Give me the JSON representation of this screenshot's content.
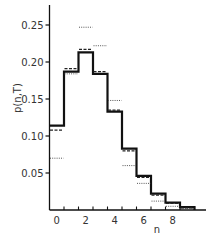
{
  "chart_data": {
    "type": "bar",
    "subtype": "step-histogram",
    "title": "",
    "xlabel": "n",
    "ylabel": "p(n,T)",
    "xlim": [
      -0.5,
      10.5
    ],
    "ylim": [
      0,
      0.277
    ],
    "x_ticks": [
      0,
      2,
      4,
      6,
      8
    ],
    "x_tick_labels": [
      "0",
      "2",
      "4",
      "6",
      "8"
    ],
    "y_ticks": [
      0.05,
      0.1,
      0.15,
      0.2,
      0.25
    ],
    "y_tick_labels": [
      "0.05",
      "0.10",
      "0.15",
      "0.20",
      "0.25"
    ],
    "grid": false,
    "legend": null,
    "categories": [
      0,
      1,
      2,
      3,
      4,
      5,
      6,
      7,
      8,
      9
    ],
    "series": [
      {
        "name": "solid",
        "style": "solid",
        "values": [
          0.114,
          0.187,
          0.213,
          0.184,
          0.133,
          0.083,
          0.046,
          0.022,
          0.01,
          0.004
        ]
      },
      {
        "name": "dashed",
        "style": "dashed",
        "values": [
          0.108,
          0.191,
          0.217,
          0.187,
          0.135,
          0.08,
          0.044,
          0.02,
          0.009,
          0.003
        ]
      },
      {
        "name": "dotted",
        "style": "dotted",
        "values": [
          0.07,
          0.184,
          0.247,
          0.222,
          0.148,
          0.06,
          0.036,
          0.012,
          0.005,
          0.002
        ]
      }
    ]
  }
}
